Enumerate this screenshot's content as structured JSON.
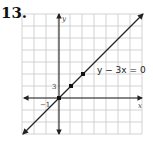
{
  "problem": {
    "number": "13."
  },
  "chart_data": {
    "type": "line",
    "title": "",
    "equation_label": "y − 3x = 0",
    "xlabel": "x",
    "ylabel": "y",
    "x_tick_labels": [
      {
        "value": -1,
        "label": "−1"
      }
    ],
    "y_tick_labels": [
      {
        "value": 3,
        "label": "3"
      }
    ],
    "grid": true,
    "x_unit_per_cell": 1,
    "y_unit_per_cell": 3,
    "xlim": [
      -3,
      7
    ],
    "ylim": [
      -9,
      21
    ],
    "series": [
      {
        "name": "y − 3x = 0",
        "slope": 3,
        "intercept": 0,
        "plotted_points": [
          {
            "x": 0,
            "y": 0
          },
          {
            "x": 1,
            "y": 3
          },
          {
            "x": 2,
            "y": 6
          }
        ]
      }
    ],
    "colors": {
      "grid": "#c8c8c8",
      "axes": "#222222",
      "line": "#222222",
      "points": "#111111"
    }
  }
}
